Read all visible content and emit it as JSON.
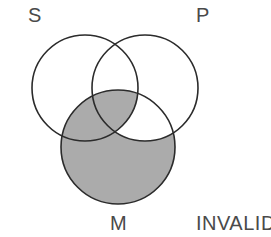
{
  "figure": {
    "type": "venn-diagram-3-circle",
    "title": "",
    "width": 271,
    "height": 237,
    "background_color": "#ffffff",
    "stroke_color": "#2b2b2b",
    "stroke_width": 1.6,
    "shade_color": "#ababab",
    "label_color": "#4a4a4a",
    "circles": [
      {
        "id": "S",
        "label": "S",
        "cx": 85,
        "cy": 88,
        "r": 53,
        "filled": false
      },
      {
        "id": "P",
        "label": "P",
        "cx": 145,
        "cy": 88,
        "r": 53,
        "filled": false
      },
      {
        "id": "M",
        "label": "M",
        "cx": 118,
        "cy": 147,
        "r": 57,
        "filled": true
      }
    ],
    "shading": {
      "description": "M circle shaded except the region inside M and P but outside S",
      "shaded_regions": [
        "M only",
        "M and S only",
        "M and S and P"
      ],
      "unshaded_regions": [
        "M and P only",
        "S only",
        "P only",
        "S and P only"
      ]
    }
  },
  "labels": {
    "s": "S",
    "p": "P",
    "m": "M",
    "verdict": "INVALID"
  }
}
